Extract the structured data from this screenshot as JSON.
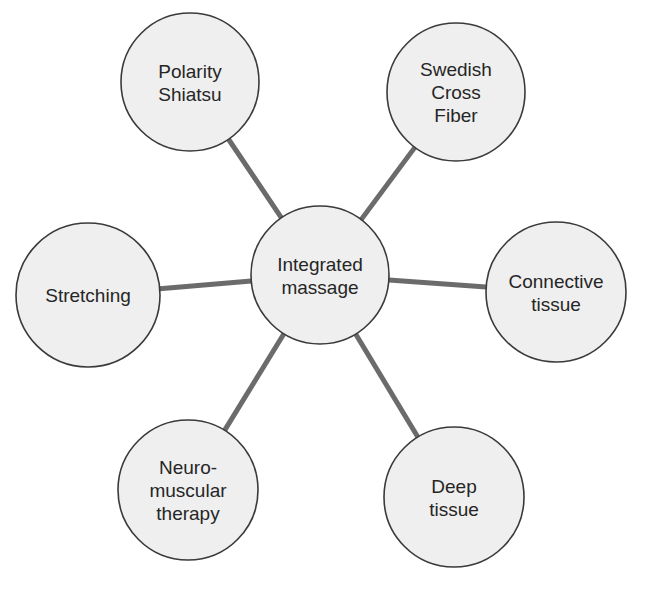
{
  "diagram": {
    "type": "hub-and-spoke",
    "colors": {
      "background": "#ffffff",
      "node_fill": "#efefef",
      "node_stroke": "#3a3a3a",
      "connector": "#6b6b6b",
      "text": "#262626"
    },
    "hub": {
      "id": "integrated-massage",
      "lines": [
        "Integrated",
        "massage"
      ],
      "cx": 320,
      "cy": 275,
      "r": 69
    },
    "nodes": [
      {
        "id": "polarity-shiatsu",
        "lines": [
          "Polarity",
          "Shiatsu"
        ],
        "cx": 190,
        "cy": 82,
        "r": 69
      },
      {
        "id": "swedish-cross-fiber",
        "lines": [
          "Swedish",
          "Cross",
          "Fiber"
        ],
        "cx": 456,
        "cy": 92,
        "r": 69
      },
      {
        "id": "stretching",
        "lines": [
          "Stretching"
        ],
        "cx": 88,
        "cy": 295,
        "r": 72
      },
      {
        "id": "connective-tissue",
        "lines": [
          "Connective",
          "tissue"
        ],
        "cx": 556,
        "cy": 292,
        "r": 70
      },
      {
        "id": "neuromuscular-therapy",
        "lines": [
          "Neuro-",
          "muscular",
          "therapy"
        ],
        "cx": 188,
        "cy": 490,
        "r": 70
      },
      {
        "id": "deep-tissue",
        "lines": [
          "Deep",
          "tissue"
        ],
        "cx": 454,
        "cy": 497,
        "r": 70
      }
    ]
  }
}
